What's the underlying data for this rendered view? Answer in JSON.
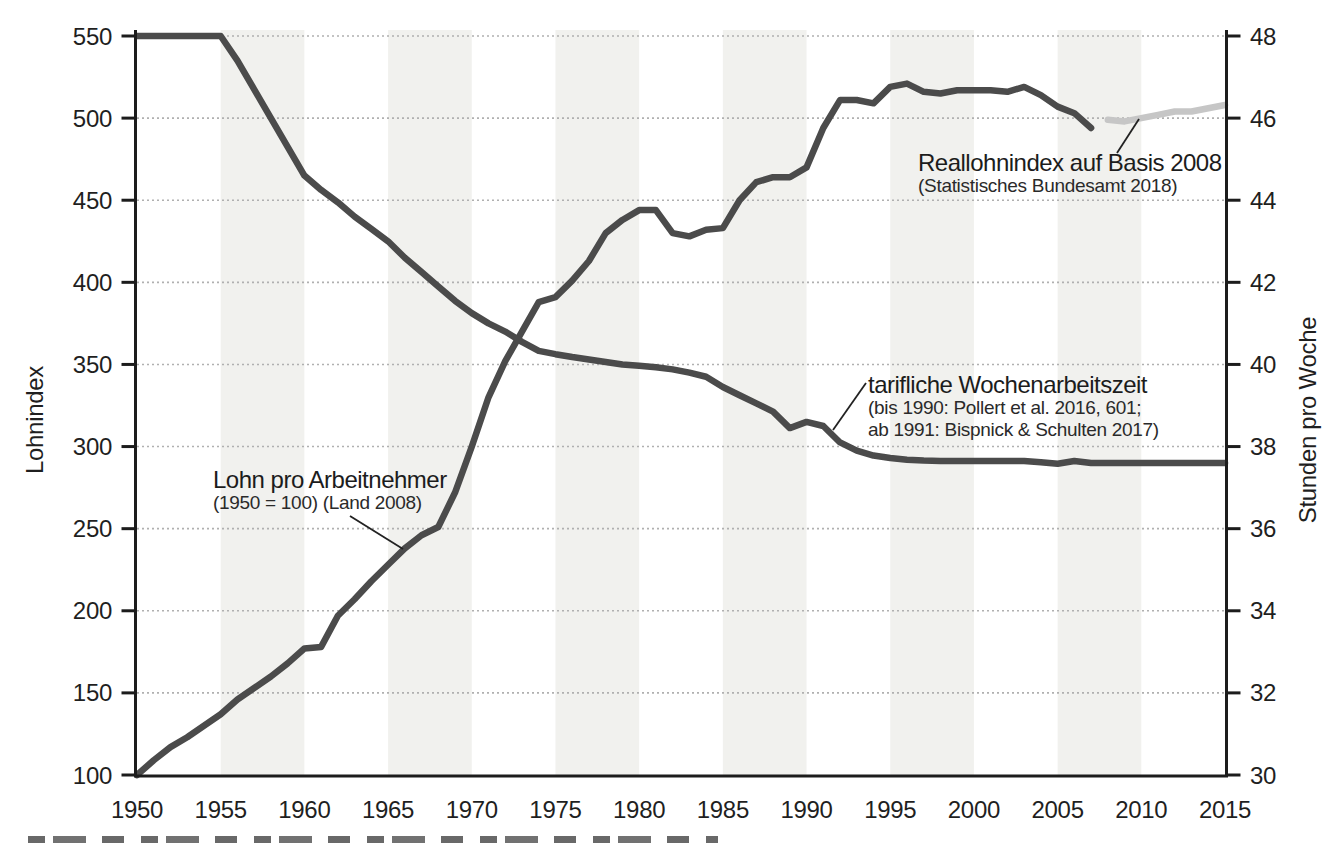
{
  "figure": {
    "description_visible_text_only": true
  },
  "chart_data": {
    "type": "line",
    "x_axis": {
      "min": 1950,
      "max": 2015,
      "tick_step": 5,
      "ticks": [
        1950,
        1955,
        1960,
        1965,
        1970,
        1975,
        1980,
        1985,
        1990,
        1995,
        2000,
        2005,
        2010,
        2015
      ]
    },
    "axis_left": {
      "title": "Lohnindex",
      "min": 100,
      "max": 550,
      "tick_step": 50,
      "ticks": [
        100,
        150,
        200,
        250,
        300,
        350,
        400,
        450,
        500,
        550
      ]
    },
    "axis_right": {
      "title": "Stunden pro Woche",
      "min": 30,
      "max": 48,
      "tick_step": 2,
      "ticks": [
        30,
        32,
        34,
        36,
        38,
        40,
        42,
        44,
        46,
        48
      ]
    },
    "grid": {
      "horizontal_dotted": true,
      "at_left_values": [
        150,
        200,
        250,
        300,
        350,
        400,
        450,
        500,
        550
      ]
    },
    "shaded_bands_year_ranges": [
      [
        1955,
        1960
      ],
      [
        1965,
        1970
      ],
      [
        1975,
        1980
      ],
      [
        1985,
        1990
      ],
      [
        1995,
        2000
      ],
      [
        2005,
        2010
      ]
    ],
    "series": [
      {
        "id": "lohn",
        "name": "Lohn pro Arbeitnehmer",
        "axis": "left",
        "color": "#4b4b4b",
        "points": [
          [
            1950,
            100
          ],
          [
            1951,
            109
          ],
          [
            1952,
            117
          ],
          [
            1953,
            123
          ],
          [
            1954,
            130
          ],
          [
            1955,
            137
          ],
          [
            1956,
            146
          ],
          [
            1957,
            153
          ],
          [
            1958,
            160
          ],
          [
            1959,
            168
          ],
          [
            1960,
            177
          ],
          [
            1961,
            178
          ],
          [
            1962,
            197
          ],
          [
            1963,
            207
          ],
          [
            1964,
            218
          ],
          [
            1965,
            228
          ],
          [
            1966,
            238
          ],
          [
            1967,
            246
          ],
          [
            1968,
            251
          ],
          [
            1969,
            272
          ],
          [
            1970,
            300
          ],
          [
            1971,
            330
          ],
          [
            1972,
            352
          ],
          [
            1973,
            370
          ],
          [
            1974,
            388
          ],
          [
            1975,
            391
          ],
          [
            1976,
            401
          ],
          [
            1977,
            413
          ],
          [
            1978,
            430
          ],
          [
            1979,
            438
          ],
          [
            1980,
            444
          ],
          [
            1981,
            444
          ],
          [
            1982,
            430
          ],
          [
            1983,
            428
          ],
          [
            1984,
            432
          ],
          [
            1985,
            433
          ],
          [
            1986,
            450
          ],
          [
            1987,
            461
          ],
          [
            1988,
            464
          ],
          [
            1989,
            464
          ],
          [
            1990,
            470
          ],
          [
            1991,
            494
          ],
          [
            1992,
            511
          ],
          [
            1993,
            511
          ],
          [
            1994,
            509
          ],
          [
            1995,
            519
          ],
          [
            1996,
            521
          ],
          [
            1997,
            516
          ],
          [
            1998,
            515
          ],
          [
            1999,
            517
          ],
          [
            2000,
            517
          ],
          [
            2001,
            517
          ],
          [
            2002,
            516
          ],
          [
            2003,
            519
          ],
          [
            2004,
            514
          ],
          [
            2005,
            507
          ],
          [
            2006,
            503
          ],
          [
            2007,
            494
          ]
        ]
      },
      {
        "id": "hours",
        "name": "tarifliche Wochenarbeitszeit",
        "axis": "right",
        "color": "#4b4b4b",
        "points": [
          [
            1950,
            48
          ],
          [
            1955,
            48
          ],
          [
            1956,
            47.4
          ],
          [
            1957,
            46.7
          ],
          [
            1958,
            46
          ],
          [
            1959,
            45.3
          ],
          [
            1960,
            44.6
          ],
          [
            1961,
            44.25
          ],
          [
            1962,
            43.95
          ],
          [
            1963,
            43.6
          ],
          [
            1964,
            43.3
          ],
          [
            1965,
            43
          ],
          [
            1966,
            42.6
          ],
          [
            1967,
            42.25
          ],
          [
            1968,
            41.9
          ],
          [
            1969,
            41.55
          ],
          [
            1970,
            41.25
          ],
          [
            1971,
            41
          ],
          [
            1972,
            40.8
          ],
          [
            1973,
            40.55
          ],
          [
            1974,
            40.33
          ],
          [
            1975,
            40.25
          ],
          [
            1976,
            40.18
          ],
          [
            1977,
            40.12
          ],
          [
            1978,
            40.06
          ],
          [
            1979,
            40
          ],
          [
            1980,
            39.97
          ],
          [
            1981,
            39.93
          ],
          [
            1982,
            39.88
          ],
          [
            1983,
            39.8
          ],
          [
            1984,
            39.7
          ],
          [
            1985,
            39.45
          ],
          [
            1986,
            39.25
          ],
          [
            1987,
            39.05
          ],
          [
            1988,
            38.85
          ],
          [
            1989,
            38.45
          ],
          [
            1990,
            38.6
          ],
          [
            1991,
            38.5
          ],
          [
            1992,
            38.1
          ],
          [
            1993,
            37.9
          ],
          [
            1994,
            37.78
          ],
          [
            1995,
            37.72
          ],
          [
            1996,
            37.68
          ],
          [
            1997,
            37.66
          ],
          [
            1998,
            37.65
          ],
          [
            2000,
            37.65
          ],
          [
            2003,
            37.65
          ],
          [
            2004,
            37.62
          ],
          [
            2005,
            37.58
          ],
          [
            2006,
            37.65
          ],
          [
            2007,
            37.6
          ],
          [
            2008,
            37.6
          ],
          [
            2010,
            37.6
          ],
          [
            2015,
            37.6
          ]
        ]
      },
      {
        "id": "reallohn",
        "name": "Reallohnindex auf Basis 2008",
        "axis": "left",
        "color": "#c6c6c6",
        "points": [
          [
            2008,
            499
          ],
          [
            2009,
            498
          ],
          [
            2010,
            500
          ],
          [
            2011,
            502
          ],
          [
            2012,
            504
          ],
          [
            2013,
            504
          ],
          [
            2014,
            506
          ],
          [
            2015,
            508
          ]
        ]
      }
    ],
    "annotations": [
      {
        "id": "lohn",
        "title": "Lohn pro Arbeitnehmer",
        "subtitle_lines": [
          "(1950 = 100) (Land 2008)"
        ],
        "pointer": [
          [
            350,
            516
          ],
          [
            403,
            549
          ]
        ]
      },
      {
        "id": "hours",
        "title": "tarifliche Wochenarbeitszeit",
        "subtitle_lines": [
          "(bis 1990: Pollert et al. 2016, 601;",
          "ab 1991: Bispnick & Schulten 2017)"
        ],
        "pointer": [
          [
            866,
            383
          ],
          [
            833,
            430
          ]
        ]
      },
      {
        "id": "reallohn",
        "title": "Reallohnindex auf Basis 2008",
        "subtitle_lines": [
          "(Statistisches Bundesamt 2018)"
        ],
        "pointer": [
          [
            1117,
            153
          ],
          [
            1139,
            119
          ]
        ]
      }
    ]
  },
  "colors": {
    "background": "#ffffff",
    "band": "#f1f1ee",
    "grid": "#b0b0b0",
    "axis": "#1c1c1c",
    "dark_line": "#4b4b4b",
    "light_line": "#c6c6c6",
    "text": "#1f1f1f",
    "pointer": "#222222"
  }
}
